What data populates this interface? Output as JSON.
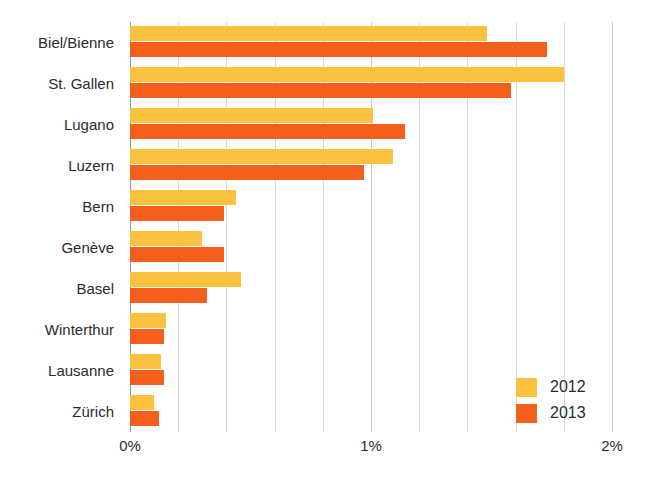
{
  "chart_data": {
    "type": "bar",
    "orientation": "horizontal",
    "title": "",
    "subtitle": "",
    "xlabel": "",
    "ylabel": "",
    "xlim": [
      0,
      2
    ],
    "xunit": "%",
    "xticks": [
      0,
      1,
      2
    ],
    "xtick_labels": [
      "0%",
      "1%",
      "2%"
    ],
    "x_gridline_values": [
      0,
      0.2,
      0.4,
      0.6,
      0.8,
      1.0,
      1.2,
      1.4,
      1.6,
      1.8,
      2.0
    ],
    "grid": true,
    "legend_position": "bottom-right",
    "categories": [
      "Biel/Bienne",
      "St. Gallen",
      "Lugano",
      "Luzern",
      "Bern",
      "Genève",
      "Basel",
      "Winterthur",
      "Lausanne",
      "Zürich"
    ],
    "series": [
      {
        "name": "2012",
        "color": "#FBC23F",
        "values": [
          1.48,
          1.8,
          1.01,
          1.09,
          0.44,
          0.3,
          0.46,
          0.15,
          0.13,
          0.1
        ]
      },
      {
        "name": "2013",
        "color": "#F4601C",
        "values": [
          1.73,
          1.58,
          1.14,
          0.97,
          0.39,
          0.39,
          0.32,
          0.14,
          0.14,
          0.12
        ]
      }
    ]
  },
  "legend": {
    "items": [
      {
        "label": "2012",
        "color": "#FBC23F"
      },
      {
        "label": "2013",
        "color": "#F4601C"
      }
    ]
  },
  "axis": {
    "x_tick_labels": [
      "0%",
      "1%",
      "2%"
    ]
  }
}
